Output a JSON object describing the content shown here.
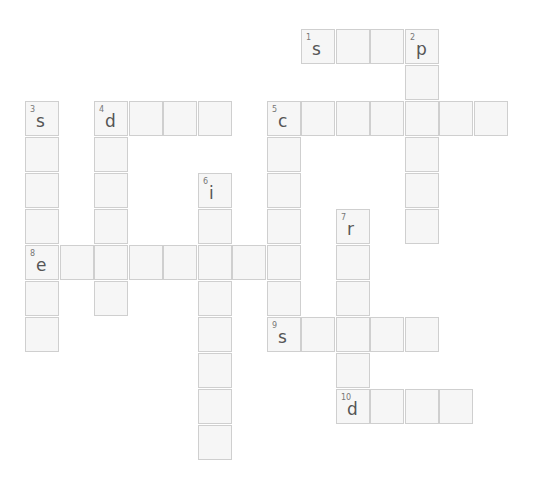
{
  "puzzle": {
    "origin": {
      "x": 25,
      "y": 29
    },
    "pitch": {
      "x": 34.5,
      "y": 36
    },
    "words": [
      {
        "number": "1",
        "letter": "s",
        "direction": "across",
        "row": 0,
        "col": 8,
        "length": 4
      },
      {
        "number": "2",
        "letter": "p",
        "direction": "down",
        "row": 0,
        "col": 11,
        "length": 6
      },
      {
        "number": "3",
        "letter": "s",
        "direction": "down",
        "row": 2,
        "col": 0,
        "length": 7
      },
      {
        "number": "4",
        "letter": "d",
        "direction": "across",
        "row": 2,
        "col": 2,
        "length": 4
      },
      {
        "number": "4",
        "letter": "d",
        "direction": "down",
        "row": 2,
        "col": 2,
        "length": 6
      },
      {
        "number": "5",
        "letter": "c",
        "direction": "across",
        "row": 2,
        "col": 7,
        "length": 7
      },
      {
        "number": "5",
        "letter": "c",
        "direction": "down",
        "row": 2,
        "col": 7,
        "length": 7
      },
      {
        "number": "6",
        "letter": "i",
        "direction": "down",
        "row": 4,
        "col": 5,
        "length": 8
      },
      {
        "number": "7",
        "letter": "r",
        "direction": "down",
        "row": 5,
        "col": 9,
        "length": 6
      },
      {
        "number": "8",
        "letter": "e",
        "direction": "across",
        "row": 6,
        "col": 0,
        "length": 8
      },
      {
        "number": "9",
        "letter": "s",
        "direction": "across",
        "row": 8,
        "col": 7,
        "length": 5
      },
      {
        "number": "10",
        "letter": "d",
        "direction": "across",
        "row": 10,
        "col": 9,
        "length": 4
      }
    ],
    "colors": {
      "cell_bg": "#f6f6f6",
      "cell_border": "#cfcfcf",
      "letter": "#555555",
      "number": "#777777"
    }
  }
}
